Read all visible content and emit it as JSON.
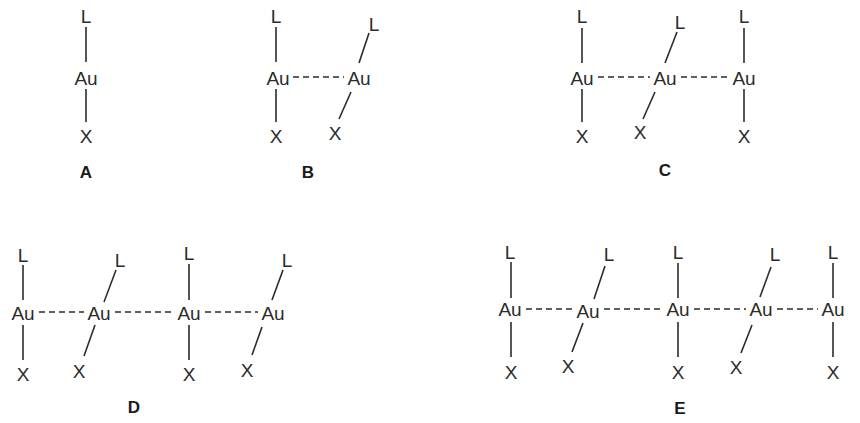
{
  "figure": {
    "colors": {
      "ink": "#2b2b2b",
      "background": "#ffffff"
    },
    "structures": [
      {
        "id": "A",
        "label": "A",
        "label_pos": [
          86,
          172
        ],
        "units": [
          {
            "au": [
              86,
              78
            ],
            "l": [
              86,
              16
            ],
            "x": [
              86,
              136
            ],
            "l_bond": [
              [
                86,
                27
              ],
              [
                86,
                62
              ]
            ],
            "x_bond": [
              [
                86,
                89
              ],
              [
                86,
                122
              ]
            ],
            "l_text": "L",
            "au_text": "Au",
            "x_text": "X"
          }
        ],
        "au_contacts": []
      },
      {
        "id": "B",
        "label": "B",
        "label_pos": [
          308,
          172
        ],
        "units": [
          {
            "au": [
              278,
              78
            ],
            "l": [
              276,
              16
            ],
            "x": [
              276,
              136
            ],
            "l_bond": [
              [
                276,
                27
              ],
              [
                276,
                62
              ]
            ],
            "x_bond": [
              [
                276,
                89
              ],
              [
                276,
                122
              ]
            ],
            "l_text": "L",
            "au_text": "Au",
            "x_text": "X"
          },
          {
            "au": [
              359,
              78
            ],
            "l": [
              374,
              24
            ],
            "x": [
              335,
              133
            ],
            "l_bond": [
              [
                369,
                33
              ],
              [
                359,
                63
              ]
            ],
            "x_bond": [
              [
                351,
                92
              ],
              [
                339,
                119
              ]
            ],
            "l_text": "L",
            "au_text": "Au",
            "x_text": "X"
          }
        ],
        "au_contacts": [
          [
            [
              293,
              77
            ],
            [
              344,
              77
            ]
          ]
        ]
      },
      {
        "id": "C",
        "label": "C",
        "label_pos": [
          665,
          170
        ],
        "units": [
          {
            "au": [
              582,
              78
            ],
            "l": [
              582,
              16
            ],
            "x": [
              582,
              136
            ],
            "l_bond": [
              [
                582,
                28
              ],
              [
                582,
                63
              ]
            ],
            "x_bond": [
              [
                582,
                89
              ],
              [
                582,
                122
              ]
            ],
            "l_text": "L",
            "au_text": "Au",
            "x_text": "X"
          },
          {
            "au": [
              665,
              78
            ],
            "l": [
              680,
              22
            ],
            "x": [
              640,
              132
            ],
            "l_bond": [
              [
                677,
                32
              ],
              [
                665,
                63
              ]
            ],
            "x_bond": [
              [
                655,
                92
              ],
              [
                643,
                119
              ]
            ],
            "l_text": "L",
            "au_text": "Au",
            "x_text": "X"
          },
          {
            "au": [
              744,
              78
            ],
            "l": [
              744,
              16
            ],
            "x": [
              744,
              136
            ],
            "l_bond": [
              [
                744,
                28
              ],
              [
                744,
                63
              ]
            ],
            "x_bond": [
              [
                744,
                89
              ],
              [
                744,
                122
              ]
            ],
            "l_text": "L",
            "au_text": "Au",
            "x_text": "X"
          }
        ],
        "au_contacts": [
          [
            [
              598,
              77
            ],
            [
              650,
              77
            ]
          ],
          [
            [
              681,
              77
            ],
            [
              729,
              77
            ]
          ]
        ]
      },
      {
        "id": "D",
        "label": "D",
        "label_pos": [
          134,
          407
        ],
        "units": [
          {
            "au": [
              23,
              313
            ],
            "l": [
              23,
              255
            ],
            "x": [
              23,
              374
            ],
            "l_bond": [
              [
                23,
                265
              ],
              [
                23,
                300
              ]
            ],
            "x_bond": [
              [
                23,
                325
              ],
              [
                23,
                360
              ]
            ],
            "l_text": "L",
            "au_text": "Au",
            "x_text": "X"
          },
          {
            "au": [
              99,
              313
            ],
            "l": [
              120,
              260
            ],
            "x": [
              79,
              371
            ],
            "l_bond": [
              [
                116,
                270
              ],
              [
                104,
                302
              ]
            ],
            "x_bond": [
              [
                95,
                325
              ],
              [
                84,
                356
              ]
            ],
            "l_text": "L",
            "au_text": "Au",
            "x_text": "X"
          },
          {
            "au": [
              189,
              313
            ],
            "l": [
              189,
              253
            ],
            "x": [
              189,
              374
            ],
            "l_bond": [
              [
                189,
                264
              ],
              [
                189,
                300
              ]
            ],
            "x_bond": [
              [
                189,
                325
              ],
              [
                189,
                360
              ]
            ],
            "l_text": "L",
            "au_text": "Au",
            "x_text": "X"
          },
          {
            "au": [
              273,
              313
            ],
            "l": [
              287,
              260
            ],
            "x": [
              247,
              370
            ],
            "l_bond": [
              [
                283,
                270
              ],
              [
                272,
                300
              ]
            ],
            "x_bond": [
              [
                262,
                327
              ],
              [
                252,
                355
              ]
            ],
            "l_text": "L",
            "au_text": "Au",
            "x_text": "X"
          }
        ],
        "au_contacts": [
          [
            [
              39,
              312
            ],
            [
              84,
              312
            ]
          ],
          [
            [
              115,
              312
            ],
            [
              174,
              312
            ]
          ],
          [
            [
              205,
              312
            ],
            [
              258,
              312
            ]
          ]
        ]
      },
      {
        "id": "E",
        "label": "E",
        "label_pos": [
          680,
          408
        ],
        "units": [
          {
            "au": [
              510,
              309
            ],
            "l": [
              510,
              252
            ],
            "x": [
              511,
              372
            ],
            "l_bond": [
              [
                511,
                262
              ],
              [
                511,
                298
              ]
            ],
            "x_bond": [
              [
                511,
                322
              ],
              [
                511,
                357
              ]
            ],
            "l_text": "L",
            "au_text": "Au",
            "x_text": "X"
          },
          {
            "au": [
              588,
              311
            ],
            "l": [
              609,
              254
            ],
            "x": [
              568,
              366
            ],
            "l_bond": [
              [
                605,
                266
              ],
              [
                594,
                299
              ]
            ],
            "x_bond": [
              [
                583,
                323
              ],
              [
                572,
                352
              ]
            ],
            "l_text": "L",
            "au_text": "Au",
            "x_text": "X"
          },
          {
            "au": [
              678,
              309
            ],
            "l": [
              678,
              252
            ],
            "x": [
              678,
              372
            ],
            "l_bond": [
              [
                678,
                263
              ],
              [
                678,
                298
              ]
            ],
            "x_bond": [
              [
                678,
                322
              ],
              [
                678,
                357
              ]
            ],
            "l_text": "L",
            "au_text": "Au",
            "x_text": "X"
          },
          {
            "au": [
              761,
              309
            ],
            "l": [
              775,
              254
            ],
            "x": [
              736,
              367
            ],
            "l_bond": [
              [
                771,
                267
              ],
              [
                760,
                297
              ]
            ],
            "x_bond": [
              [
                752,
                325
              ],
              [
                741,
                353
              ]
            ],
            "l_text": "L",
            "au_text": "Au",
            "x_text": "X"
          },
          {
            "au": [
              833,
              309
            ],
            "l": [
              833,
              252
            ],
            "x": [
              833,
              372
            ],
            "l_bond": [
              [
                833,
                263
              ],
              [
                833,
                298
              ]
            ],
            "x_bond": [
              [
                833,
                322
              ],
              [
                833,
                357
              ]
            ],
            "l_text": "L",
            "au_text": "Au",
            "x_text": "X"
          }
        ],
        "au_contacts": [
          [
            [
              526,
              309
            ],
            [
              573,
              309
            ]
          ],
          [
            [
              604,
              309
            ],
            [
              663,
              309
            ]
          ],
          [
            [
              694,
              309
            ],
            [
              746,
              309
            ]
          ],
          [
            [
              777,
              309
            ],
            [
              818,
              309
            ]
          ]
        ]
      }
    ]
  }
}
